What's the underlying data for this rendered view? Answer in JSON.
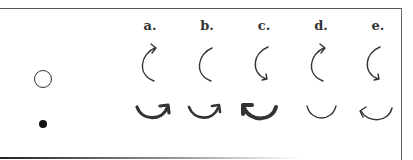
{
  "figure": {
    "type": "diagram",
    "legend": [
      {
        "symbol": "open-circle",
        "meaning": ""
      },
      {
        "symbol": "filled-dot",
        "meaning": ""
      }
    ],
    "options": [
      {
        "label": "a.",
        "upper": "arc-open-right-arrow-at-top",
        "lower": "thick-cup-arrow-pointing-up-right"
      },
      {
        "label": "b.",
        "upper": "arc-open-right-no-arrow",
        "lower": "thick-cup-arrow-pointing-up-right"
      },
      {
        "label": "c.",
        "upper": "arc-open-right-arrow-at-bottom",
        "lower": "very-thick-cup-arrow-pointing-up-left"
      },
      {
        "label": "d.",
        "upper": "arc-open-right-arrow-at-top",
        "lower": "thin-cup-no-arrow"
      },
      {
        "label": "e.",
        "upper": "arc-open-right-arrow-at-bottom",
        "lower": "thin-cup-arrow-pointing-up-left"
      }
    ],
    "colors": {
      "stroke": "#333333",
      "frame": "#555555",
      "background": "#ffffff"
    }
  }
}
